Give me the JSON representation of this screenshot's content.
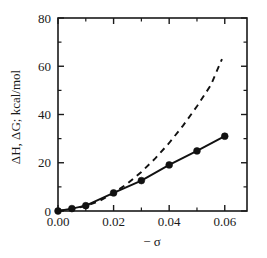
{
  "chart_data": {
    "type": "line",
    "title": "",
    "xlabel": "− σ",
    "ylabel": "ΔH, ΔG; kcal/mol",
    "xlim": [
      0.0,
      0.068
    ],
    "ylim": [
      0,
      80
    ],
    "grid": false,
    "legend_position": "none",
    "frame": "box",
    "x_major_ticks": [
      0.0,
      0.02,
      0.04,
      0.06
    ],
    "x_major_tick_labels": [
      "0.00",
      "0.02",
      "0.04",
      "0.06"
    ],
    "x_minor_ticks": [
      0.01,
      0.03,
      0.05
    ],
    "y_major_ticks": [
      0,
      20,
      40,
      60,
      80
    ],
    "y_major_tick_labels": [
      "0",
      "20",
      "40",
      "60",
      "80"
    ],
    "y_minor_ticks": [
      10,
      30,
      50,
      70
    ],
    "series": [
      {
        "name": "ΔH",
        "style": "solid",
        "marker": "filled-circle",
        "x": [
          0.0,
          0.005,
          0.01,
          0.02,
          0.03,
          0.04,
          0.05,
          0.06
        ],
        "values": [
          0.0,
          1.0,
          2.2,
          7.5,
          12.6,
          19.1,
          24.9,
          31.0
        ]
      },
      {
        "name": "ΔG",
        "style": "dashed",
        "marker": "none",
        "x": [
          0.0,
          0.005,
          0.01,
          0.015,
          0.02,
          0.025,
          0.03,
          0.035,
          0.04,
          0.045,
          0.05,
          0.055,
          0.059
        ],
        "values": [
          0.0,
          0.9,
          2.1,
          4.2,
          7.4,
          11.4,
          16.2,
          21.8,
          28.2,
          35.4,
          43.4,
          52.2,
          63.0
        ]
      }
    ]
  },
  "axis_labels": {
    "x_title": "− σ",
    "y_title": "ΔH, ΔG; kcal/mol"
  }
}
